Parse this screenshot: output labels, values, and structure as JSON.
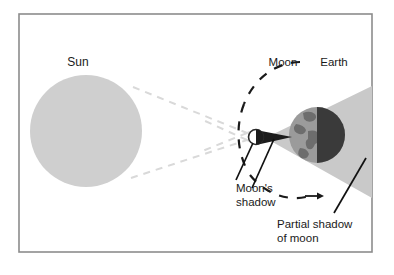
{
  "figure": {
    "frame": {
      "stroke_color": "#8c8c8c",
      "background": "#ffffff"
    }
  },
  "labels": {
    "sun": "Sun",
    "moon": "Moon",
    "earth": "Earth",
    "moons_shadow_line1": "Moon's",
    "moons_shadow_line2": "shadow",
    "partial_shadow_line1": "Partial shadow",
    "partial_shadow_line2": "of moon"
  },
  "bodies": {
    "sun": {
      "name": "Sun",
      "fill": "#cfcfcf",
      "cx": 86,
      "cy": 131,
      "r": 56
    },
    "moon": {
      "name": "Moon",
      "fill": "#ffffff",
      "stroke": "#2b2b2b",
      "cx": 256,
      "cy": 137,
      "r": 7
    },
    "earth": {
      "name": "Earth",
      "lit_fill": "#9b9b9b",
      "dark_fill": "#3a3a3a",
      "continent_fill": "#6d6d6d",
      "cx": 317,
      "cy": 135,
      "r": 28
    }
  },
  "shadows": {
    "umbra": {
      "name": "Moon's shadow (umbra)",
      "fill": "#1c1c1c"
    },
    "penumbra": {
      "name": "Partial shadow of moon (penumbra)",
      "fill": "#c9c9c9"
    }
  },
  "rays": {
    "name": "sunlight tangent rays",
    "stroke": "#d8d8d8",
    "style": "dashed"
  },
  "orbit": {
    "name": "moon orbit arc",
    "stroke": "#1a1a1a",
    "style": "dashed",
    "direction_arrow": "right"
  },
  "leader_lines": {
    "stroke": "#111111"
  }
}
